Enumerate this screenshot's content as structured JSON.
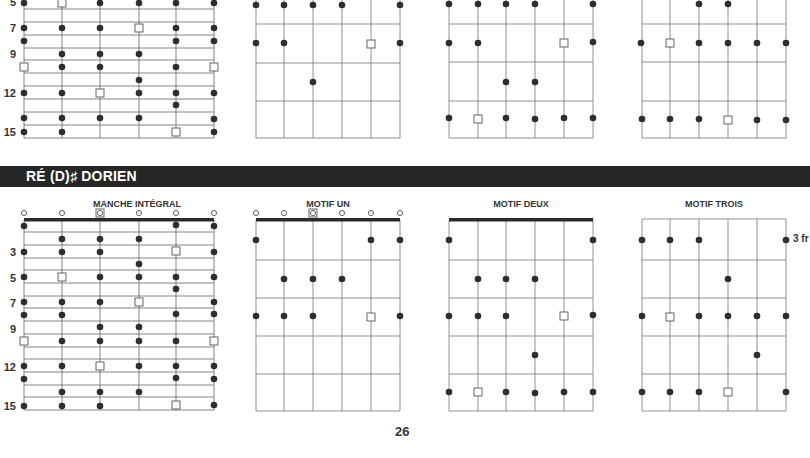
{
  "page": {
    "number": "26"
  },
  "section": {
    "title": "RÉ (D)♯ DORIEN"
  },
  "top_section": {
    "fret_numbers": [
      "5",
      "7",
      "9",
      "12",
      "15"
    ],
    "diagrams": [
      {
        "name": "manche-integral-partial"
      },
      {
        "name": "motif-un-partial"
      },
      {
        "name": "motif-deux-partial"
      },
      {
        "name": "motif-trois-partial"
      }
    ]
  },
  "bottom_section": {
    "diagrams": [
      {
        "title": "MANCHE INTÉGRAL"
      },
      {
        "title": "MOTIF UN"
      },
      {
        "title": "MOTIF DEUX"
      },
      {
        "title": "MOTIF TROIS"
      }
    ],
    "fret_numbers": [
      "3",
      "5",
      "7",
      "9",
      "12",
      "15"
    ],
    "position_label": "3 fr"
  },
  "legend": {
    "dot": "scale-note",
    "square": "root-note",
    "circle": "open-string"
  }
}
